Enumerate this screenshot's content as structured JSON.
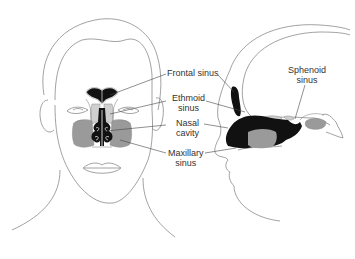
{
  "diagram": {
    "type": "anatomical-illustration",
    "colors": {
      "outline": "#8a8a8a",
      "dark_fill": "#111111",
      "gray_fill": "#9a9a9a",
      "light_fill": "#cfcfcf",
      "label_text": "#333333",
      "leader_line": "#444444"
    },
    "labels": {
      "frontal": {
        "line1": "Frontal sinus"
      },
      "ethmoid": {
        "line1": "Ethmoid",
        "line2": "sinus"
      },
      "nasal": {
        "line1": "Nasal",
        "line2": "cavity"
      },
      "maxillary": {
        "line1": "Maxillary",
        "line2": "sinus"
      },
      "sphenoid": {
        "line1": "Sphenoid",
        "line2": "sinus"
      }
    }
  }
}
